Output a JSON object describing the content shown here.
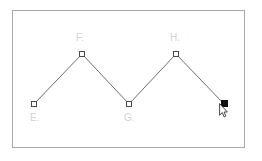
{
  "app": {
    "title": "Geometry Canvas",
    "background_color": "#ffffff"
  },
  "canvas": {
    "frame": {
      "border_color": "#a8a8ac",
      "fill_color": "#ffffff"
    },
    "shape": {
      "type": "polyline",
      "stroke_color": "#6e6e72",
      "stroke_width": 1
    },
    "label_color": "#d2d2d4",
    "marker_color": "#4a4a4a",
    "selected_marker_color": "#111111",
    "vertices": [
      {
        "id": "E",
        "label": "E.",
        "x": 34,
        "y": 104,
        "selected": false
      },
      {
        "id": "F",
        "label": "F.",
        "x": 82,
        "y": 54,
        "selected": false
      },
      {
        "id": "G",
        "label": "G.",
        "x": 129,
        "y": 104,
        "selected": false
      },
      {
        "id": "H",
        "label": "H.",
        "x": 176,
        "y": 54,
        "selected": false
      },
      {
        "id": "I",
        "label": "",
        "x": 224,
        "y": 104,
        "selected": true
      }
    ],
    "labels": [
      {
        "text": "E.",
        "x": 30,
        "y": 113
      },
      {
        "text": "F.",
        "x": 76,
        "y": 33
      },
      {
        "text": "G.",
        "x": 124,
        "y": 113
      },
      {
        "text": "H.",
        "x": 170,
        "y": 33
      }
    ]
  },
  "cursor": {
    "name": "mouse-pointer",
    "x": 219,
    "y": 103
  }
}
